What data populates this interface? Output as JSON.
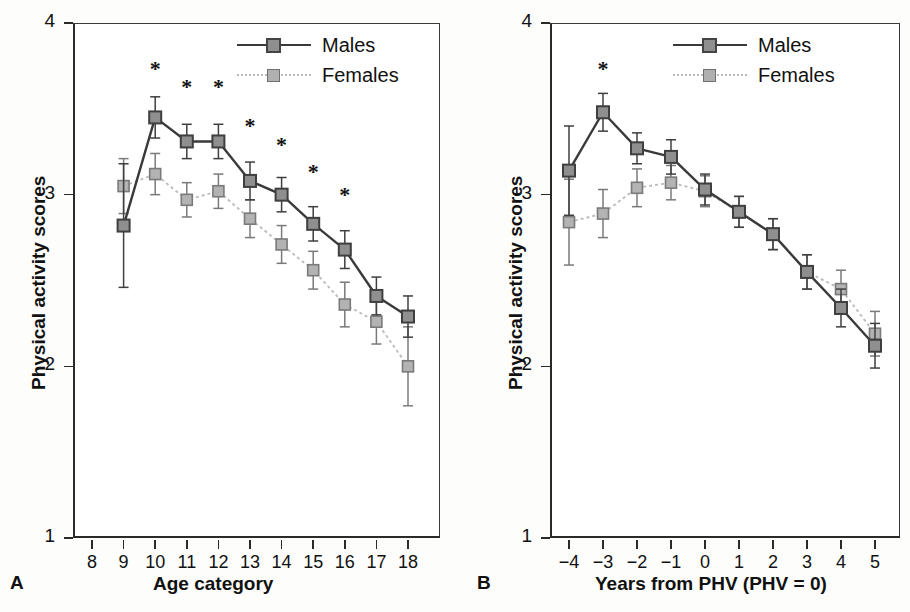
{
  "figure": {
    "y_axis_label": "Physical activity scores",
    "y_ticks": [
      "4",
      "3",
      "2",
      "1"
    ],
    "legend": [
      {
        "label": "Males",
        "key": "males",
        "color": "#8f8f8f",
        "line": "solid"
      },
      {
        "label": "Females",
        "key": "females",
        "color": "#b0b0b0",
        "line": "dotted"
      }
    ],
    "significance_marker": "*"
  },
  "panelA": {
    "letter": "A",
    "x_axis_label": "Age category",
    "y_axis_label": "Physical activity scores"
  },
  "panelB": {
    "letter": "B",
    "x_axis_label": "Years from PHV (PHV = 0)",
    "y_axis_label": "Physical activity scores"
  },
  "chart_data": [
    {
      "type": "line",
      "panel": "A",
      "title": "",
      "xlabel": "Age category",
      "ylabel": "Physical activity scores",
      "xlim": [
        8,
        18
      ],
      "ylim": [
        1,
        4
      ],
      "xticks": [
        8,
        9,
        10,
        11,
        12,
        13,
        14,
        15,
        16,
        17,
        18
      ],
      "xtick_labels": [
        "8",
        "9",
        "10",
        "11",
        "12",
        "13",
        "14",
        "15",
        "16",
        "17",
        "18"
      ],
      "yticks": [
        1,
        2,
        3,
        4
      ],
      "ytick_labels": [
        "1",
        "2",
        "3",
        "4"
      ],
      "grid": false,
      "legend_position": "top-right",
      "error_bars": "95% CI",
      "series": [
        {
          "name": "Males",
          "x": [
            9,
            10,
            11,
            12,
            13,
            14,
            15,
            16,
            17,
            18
          ],
          "values": [
            2.82,
            3.45,
            3.31,
            3.31,
            3.08,
            3.0,
            2.83,
            2.68,
            2.41,
            2.29
          ],
          "err_low": [
            0.36,
            0.12,
            0.1,
            0.1,
            0.11,
            0.1,
            0.1,
            0.11,
            0.11,
            0.12
          ],
          "err_high": [
            0.36,
            0.12,
            0.1,
            0.1,
            0.11,
            0.1,
            0.1,
            0.11,
            0.11,
            0.12
          ]
        },
        {
          "name": "Females",
          "x": [
            9,
            10,
            11,
            12,
            13,
            14,
            15,
            16,
            17,
            18
          ],
          "values": [
            3.05,
            3.12,
            2.97,
            3.02,
            2.86,
            2.71,
            2.56,
            2.36,
            2.26,
            2.0
          ],
          "err_low": [
            0.16,
            0.12,
            0.1,
            0.1,
            0.11,
            0.11,
            0.11,
            0.13,
            0.13,
            0.23
          ],
          "err_high": [
            0.16,
            0.12,
            0.1,
            0.1,
            0.11,
            0.11,
            0.11,
            0.13,
            0.13,
            0.23
          ]
        }
      ],
      "significance": {
        "symbol": "*",
        "x": [
          10,
          11,
          12,
          13,
          14,
          15,
          16
        ],
        "y": [
          3.73,
          3.63,
          3.63,
          3.4,
          3.29,
          3.13,
          3.0
        ]
      }
    },
    {
      "type": "line",
      "panel": "B",
      "title": "",
      "xlabel": "Years from PHV (PHV = 0)",
      "ylabel": "Physical activity scores",
      "xlim": [
        -4,
        5
      ],
      "ylim": [
        1,
        4
      ],
      "xticks": [
        -4,
        -3,
        -2,
        -1,
        0,
        1,
        2,
        3,
        4,
        5
      ],
      "xtick_labels": [
        "−4",
        "−3",
        "−2",
        "−1",
        "0",
        "1",
        "2",
        "3",
        "4",
        "5"
      ],
      "yticks": [
        1,
        2,
        3,
        4
      ],
      "ytick_labels": [
        "1",
        "2",
        "3",
        "4"
      ],
      "grid": false,
      "legend_position": "top-right",
      "error_bars": "95% CI",
      "series": [
        {
          "name": "Males",
          "x": [
            -4,
            -3,
            -2,
            -1,
            0,
            1,
            2,
            3,
            4,
            5
          ],
          "values": [
            3.14,
            3.48,
            3.27,
            3.22,
            3.03,
            2.9,
            2.77,
            2.55,
            2.34,
            2.12
          ],
          "err_low": [
            0.26,
            0.11,
            0.09,
            0.1,
            0.09,
            0.09,
            0.09,
            0.1,
            0.11,
            0.13
          ],
          "err_high": [
            0.26,
            0.11,
            0.09,
            0.1,
            0.09,
            0.09,
            0.09,
            0.1,
            0.11,
            0.13
          ]
        },
        {
          "name": "Females",
          "x": [
            -4,
            -3,
            -2,
            -1,
            0,
            1,
            2,
            3,
            4,
            5
          ],
          "values": [
            2.84,
            2.89,
            3.04,
            3.07,
            3.02,
            2.9,
            2.77,
            2.55,
            2.45,
            2.19
          ],
          "err_low": [
            0.25,
            0.14,
            0.11,
            0.1,
            0.09,
            0.09,
            0.09,
            0.1,
            0.11,
            0.13
          ],
          "err_high": [
            0.25,
            0.14,
            0.11,
            0.1,
            0.09,
            0.09,
            0.09,
            0.1,
            0.11,
            0.13
          ]
        }
      ],
      "significance": {
        "symbol": "*",
        "x": [
          -3
        ],
        "y": [
          3.73
        ]
      }
    }
  ]
}
